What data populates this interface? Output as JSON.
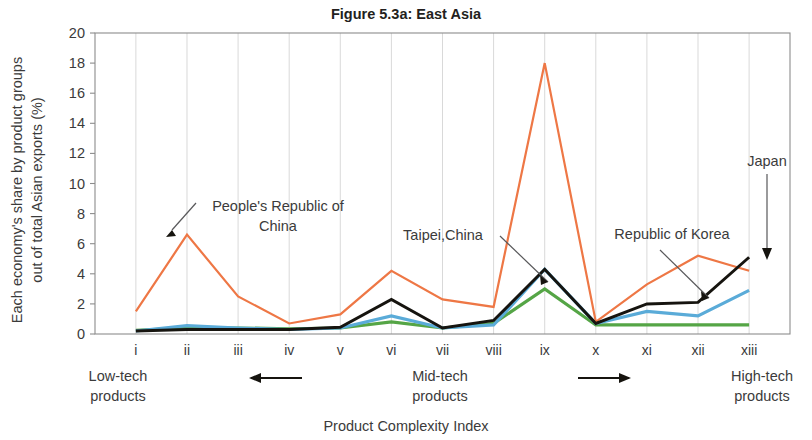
{
  "figure": {
    "title": "Figure 5.3a: East Asia",
    "x_axis_title": "Product Complexity Index",
    "y_axis_title": "Each economy's share by product groups out of total Asian exports (%)"
  },
  "annotations": {
    "prc": "People's Republic of China",
    "prc_line1": "People's Republic of",
    "prc_line2": "China",
    "taipei": "Taipei,China",
    "korea": "Republic of Korea",
    "japan": "Japan"
  },
  "groups": {
    "low": "Low-tech products",
    "low_line1": "Low-tech",
    "low_line2": "products",
    "mid": "Mid-tech products",
    "mid_line1": "Mid-tech",
    "mid_line2": "products",
    "high": "High-tech products",
    "high_line1": "High-tech",
    "high_line2": "products",
    "arrow_left": "left-arrow",
    "arrow_right": "right-arrow"
  },
  "colors": {
    "prc": "#ee7745",
    "taipei": "#55a546",
    "korea": "#5aabd8",
    "japan": "#16140f",
    "grid": "#d9d9d9",
    "axis": "#8c8c8c",
    "text": "#3b3b3b"
  },
  "chart_data": {
    "type": "line",
    "title": "Figure 5.3a: East Asia",
    "xlabel": "Product Complexity Index",
    "ylabel": "Each economy's share by product groups out of total Asian exports (%)",
    "categories": [
      "i",
      "ii",
      "iii",
      "iv",
      "v",
      "vi",
      "vii",
      "viii",
      "ix",
      "x",
      "xi",
      "xii",
      "xiii"
    ],
    "yticks": [
      0,
      2,
      4,
      6,
      8,
      10,
      12,
      14,
      16,
      18,
      20
    ],
    "ylim": [
      0,
      20
    ],
    "grid": "vertical-only",
    "legend": "annotated-callouts",
    "series": [
      {
        "name": "People's Republic of China",
        "color": "#ee7745",
        "values": [
          1.5,
          6.6,
          2.5,
          0.7,
          1.3,
          4.2,
          2.3,
          1.8,
          18.0,
          0.8,
          3.3,
          5.2,
          4.2
        ]
      },
      {
        "name": "Japan",
        "color": "#16140f",
        "values": [
          0.2,
          0.3,
          0.3,
          0.3,
          0.45,
          2.3,
          0.4,
          0.9,
          4.3,
          0.7,
          2.0,
          2.1,
          5.1
        ]
      },
      {
        "name": "Republic of Korea",
        "color": "#5aabd8",
        "values": [
          0.2,
          0.55,
          0.4,
          0.3,
          0.4,
          1.2,
          0.4,
          0.6,
          4.3,
          0.7,
          1.5,
          1.2,
          2.9
        ]
      },
      {
        "name": "Taipei,China",
        "color": "#55a546",
        "values": [
          0.25,
          0.4,
          0.4,
          0.35,
          0.4,
          0.8,
          0.4,
          0.7,
          3.0,
          0.6,
          0.6,
          0.6,
          0.6
        ]
      }
    ],
    "group_bands": [
      {
        "label": "Low-tech products",
        "categories": [
          "i",
          "ii",
          "iii",
          "iv"
        ]
      },
      {
        "label": "Mid-tech products",
        "categories": [
          "v",
          "vi",
          "vii",
          "viii",
          "ix",
          "x",
          "xi"
        ]
      },
      {
        "label": "High-tech products",
        "categories": [
          "xii",
          "xiii"
        ]
      }
    ]
  }
}
